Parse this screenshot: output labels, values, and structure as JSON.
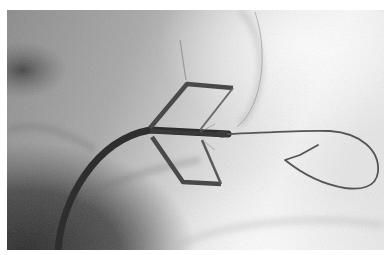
{
  "image": {
    "kind": "fluoroscopy",
    "description": "Grayscale fluoroscopic image of a catheter-delivered device with a quadrilateral wire frame and a looped guidewire",
    "colors": {
      "page_background": "#ffffff",
      "dark_tissue": "#3a3a3a",
      "mid_tissue": "#9a9a9a",
      "bright_field": "#f2f2f2",
      "device": "#4a4a4a",
      "catheter": "#2e2e2e",
      "wire": "#555555"
    }
  }
}
